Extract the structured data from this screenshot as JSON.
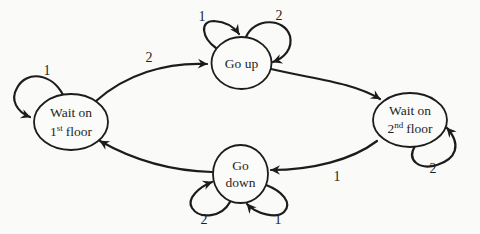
{
  "diagram": {
    "type": "state-transition-diagram",
    "colors": {
      "ink": "#1c1c1c",
      "background": "#fafaf8",
      "node_fill": "#fbfbf9"
    },
    "nodes": {
      "wait_first": {
        "line1": "Wait on",
        "floor_num": "1",
        "floor_sup": "st",
        "floor_word": "floor"
      },
      "go_up": {
        "label": "Go up"
      },
      "go_down": {
        "line1": "Go",
        "line2": "down"
      },
      "wait_second": {
        "line1": "Wait on",
        "floor_num": "2",
        "floor_sup": "nd",
        "floor_word": "floor"
      }
    },
    "edge_labels": {
      "wait_first_self": "1",
      "wait_first_to_go_up": "2",
      "go_up_self_left": "1",
      "go_up_self_right": "2",
      "go_up_to_wait_second": "",
      "wait_second_self": "2",
      "wait_second_to_go_down": "1",
      "go_down_self_left": "2",
      "go_down_self_right": "1",
      "go_down_to_wait_first": ""
    }
  }
}
